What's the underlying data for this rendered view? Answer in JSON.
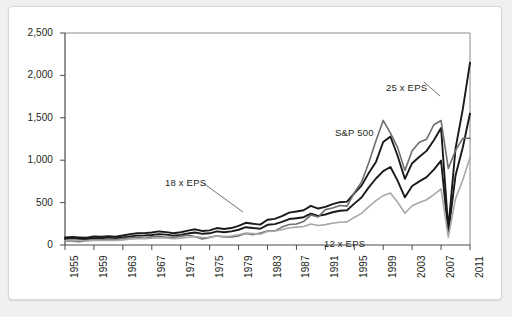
{
  "chart_data": {
    "type": "line",
    "title": "",
    "subtitle": "",
    "xlabel": "",
    "ylabel": "",
    "ylim": [
      0,
      2500
    ],
    "xlim": [
      1955,
      2011
    ],
    "grid": false,
    "legend_position": "inline-annotations",
    "ytick_labels": [
      "2,500",
      "2,000",
      "1,500",
      "1,000",
      "500",
      "0"
    ],
    "yticks": [
      2500,
      2000,
      1500,
      1000,
      500,
      0
    ],
    "xtick_labels": [
      "1955",
      "1959",
      "1963",
      "1967",
      "1971",
      "1975",
      "1979",
      "1983",
      "1987",
      "1991",
      "1995",
      "1999",
      "2003",
      "2007",
      "2011"
    ],
    "xticks": [
      1955,
      1959,
      1963,
      1967,
      1971,
      1975,
      1979,
      1983,
      1987,
      1991,
      1995,
      1999,
      2003,
      2007,
      2011
    ],
    "x": [
      1955,
      1956,
      1957,
      1958,
      1959,
      1960,
      1961,
      1962,
      1963,
      1964,
      1965,
      1966,
      1967,
      1968,
      1969,
      1970,
      1971,
      1972,
      1973,
      1974,
      1975,
      1976,
      1977,
      1978,
      1979,
      1980,
      1981,
      1982,
      1983,
      1984,
      1985,
      1986,
      1987,
      1988,
      1989,
      1990,
      1991,
      1992,
      1993,
      1994,
      1995,
      1996,
      1997,
      1998,
      1999,
      2000,
      2001,
      2002,
      2003,
      2004,
      2005,
      2006,
      2007,
      2008,
      2009,
      2010,
      2011
    ],
    "series": [
      {
        "name": "25 x EPS",
        "color": "#1a1a1a",
        "width": 1.9,
        "values": [
          88,
          95,
          90,
          85,
          100,
          98,
          105,
          98,
          112,
          128,
          138,
          140,
          148,
          160,
          152,
          138,
          150,
          170,
          185,
          165,
          172,
          200,
          188,
          200,
          225,
          262,
          250,
          240,
          298,
          308,
          340,
          382,
          395,
          410,
          462,
          430,
          450,
          482,
          505,
          512,
          610,
          700,
          850,
          980,
          1215,
          1280,
          1050,
          780,
          965,
          1040,
          1110,
          1235,
          1380,
          190,
          1140,
          1600,
          2150
        ]
      },
      {
        "name": "18 x EPS",
        "color": "#1a1a1a",
        "width": 1.9,
        "values": [
          72,
          78,
          74,
          70,
          80,
          79,
          84,
          79,
          90,
          102,
          110,
          112,
          118,
          128,
          122,
          110,
          120,
          136,
          148,
          132,
          138,
          160,
          150,
          160,
          180,
          210,
          200,
          192,
          238,
          246,
          272,
          306,
          316,
          328,
          370,
          344,
          360,
          386,
          404,
          410,
          488,
          560,
          680,
          784,
          872,
          920,
          756,
          562,
          695,
          750,
          800,
          890,
          995,
          140,
          820,
          1150,
          1550
        ]
      },
      {
        "name": "S&P 500",
        "color": "#6e6e6e",
        "width": 1.6,
        "values": [
          45,
          46,
          40,
          55,
          60,
          58,
          72,
          63,
          75,
          85,
          92,
          80,
          96,
          104,
          92,
          92,
          102,
          118,
          98,
          70,
          90,
          108,
          95,
          96,
          108,
          136,
          122,
          141,
          165,
          167,
          211,
          242,
          247,
          278,
          353,
          330,
          417,
          436,
          466,
          459,
          616,
          741,
          970,
          1229,
          1469,
          1320,
          1148,
          880,
          1112,
          1212,
          1248,
          1418,
          1468,
          903,
          1115,
          1258,
          1258
        ]
      },
      {
        "name": "12 x EPS",
        "color": "#a8a8a8",
        "width": 1.6,
        "values": [
          48,
          52,
          50,
          47,
          54,
          53,
          56,
          53,
          60,
          68,
          74,
          75,
          79,
          86,
          82,
          74,
          80,
          91,
          99,
          88,
          92,
          107,
          100,
          107,
          120,
          140,
          134,
          128,
          159,
          164,
          181,
          204,
          211,
          219,
          247,
          229,
          240,
          257,
          269,
          273,
          325,
          373,
          453,
          523,
          582,
          613,
          504,
          375,
          463,
          500,
          534,
          593,
          663,
          92,
          547,
          767,
          1033
        ]
      }
    ],
    "annotations": [
      {
        "text": "25 x EPS",
        "x": 386,
        "y": 82
      },
      {
        "text": "S&P 500",
        "x": 335,
        "y": 127
      },
      {
        "text": "18 x EPS",
        "x": 165,
        "y": 177
      },
      {
        "text": "12 x EPS",
        "x": 324,
        "y": 238
      }
    ]
  },
  "plot": {
    "left": 65,
    "right": 470,
    "top": 33,
    "bottom": 245,
    "axis_color": "#3a3a3a",
    "frame_color": "#d8d8d8",
    "background": "#ffffff",
    "page_background": "#f0f0f0"
  }
}
